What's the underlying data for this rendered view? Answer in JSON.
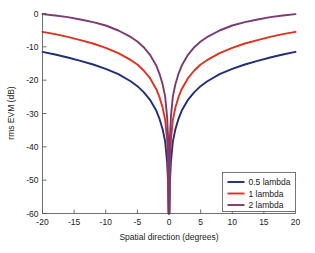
{
  "chart_data": {
    "type": "line",
    "title": "",
    "xlabel": "Spatial direction (degrees)",
    "ylabel": "rms EVM (dB)",
    "xlim": [
      -20,
      20
    ],
    "ylim": [
      -60,
      0
    ],
    "xticks": [
      -20,
      -15,
      -10,
      -5,
      0,
      5,
      10,
      15,
      20
    ],
    "xticklabels": [
      "-20",
      "-15",
      "-10",
      "-5",
      "0",
      "5",
      "10",
      "15",
      "20"
    ],
    "yticks": [
      0,
      -10,
      -20,
      -30,
      -40,
      -50,
      -60
    ],
    "yticklabels": [
      "0",
      "-10",
      "-20",
      "-30",
      "-40",
      "-50",
      "-60"
    ],
    "grid": false,
    "legend_position": "lower right",
    "x": [
      -20,
      -18,
      -16,
      -14,
      -12,
      -10,
      -8,
      -6,
      -5,
      -4,
      -3,
      -2,
      -1.5,
      -1,
      -0.6,
      -0.3,
      -0.15,
      -0.05,
      0,
      0.05,
      0.15,
      0.3,
      0.6,
      1,
      1.5,
      2,
      3,
      4,
      5,
      6,
      8,
      10,
      12,
      14,
      16,
      18,
      20
    ],
    "series": [
      {
        "name": "0.5 lambda",
        "color": "#1f2d7a",
        "values": [
          -11.5,
          -12.3,
          -13.2,
          -14.2,
          -15.3,
          -16.6,
          -18.2,
          -20.4,
          -21.8,
          -23.6,
          -25.9,
          -29.2,
          -31.6,
          -34.8,
          -38.5,
          -44.5,
          -50.4,
          -60,
          -60,
          -60,
          -50.4,
          -44.5,
          -38.5,
          -34.8,
          -31.6,
          -29.2,
          -25.9,
          -23.6,
          -21.8,
          -20.4,
          -18.2,
          -16.6,
          -15.3,
          -14.2,
          -13.2,
          -12.3,
          -11.5
        ]
      },
      {
        "name": "1 lambda",
        "color": "#e0301e",
        "values": [
          -5.5,
          -6.2,
          -7.0,
          -8.0,
          -9.0,
          -10.3,
          -11.9,
          -14.0,
          -15.3,
          -17.1,
          -19.4,
          -22.7,
          -25.1,
          -28.3,
          -32.0,
          -38.0,
          -43.9,
          -60,
          -60,
          -60,
          -43.9,
          -38.0,
          -32.0,
          -28.3,
          -25.1,
          -22.7,
          -19.4,
          -17.1,
          -15.3,
          -14.0,
          -11.9,
          -10.3,
          -9.0,
          -8.0,
          -7.0,
          -6.2,
          -5.5
        ]
      },
      {
        "name": "2 lambda",
        "color": "#7b3b72",
        "values": [
          -0.2,
          -0.6,
          -1.1,
          -1.8,
          -2.6,
          -3.6,
          -5.1,
          -7.1,
          -8.4,
          -10.1,
          -12.4,
          -15.7,
          -18.1,
          -21.3,
          -25.0,
          -31.0,
          -36.9,
          -60,
          -60,
          -60,
          -36.9,
          -31.0,
          -25.0,
          -21.3,
          -18.1,
          -15.7,
          -12.4,
          -10.1,
          -8.4,
          -7.1,
          -5.1,
          -3.6,
          -2.6,
          -1.8,
          -1.1,
          -0.6,
          -0.2
        ]
      }
    ],
    "legend_entries": [
      {
        "label": "0.5 lambda",
        "color": "#1f2d7a"
      },
      {
        "label": "1 lambda",
        "color": "#e0301e"
      },
      {
        "label": "2 lambda",
        "color": "#7b3b72"
      }
    ]
  }
}
